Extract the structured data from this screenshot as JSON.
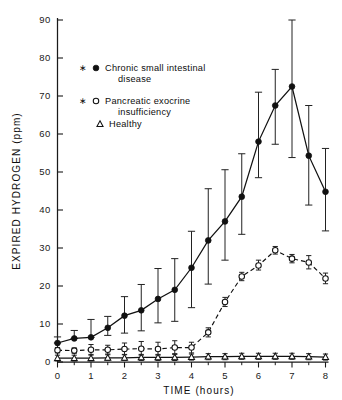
{
  "chart_data": {
    "type": "line",
    "title": "",
    "xlabel": "TIME (hours)",
    "ylabel": "EXPIRED HYDROGEN (ppm)",
    "xlim": [
      0,
      8
    ],
    "ylim": [
      0,
      90
    ],
    "xticks": [
      0,
      1,
      2,
      3,
      4,
      5,
      6,
      7,
      8
    ],
    "xtick_labels": [
      "0",
      "1",
      "2",
      "3",
      "4",
      "5",
      "6",
      "7",
      "8"
    ],
    "yticks": [
      0,
      10,
      20,
      30,
      40,
      50,
      60,
      70,
      80,
      90
    ],
    "ytick_labels": [
      "0",
      "10",
      "20",
      "30",
      "40",
      "50",
      "60",
      "70",
      "80",
      "90"
    ],
    "x_minor_step": 0.5,
    "grid": false,
    "legend_position": "upper-left-inset",
    "x": [
      0,
      0.5,
      1,
      1.5,
      2,
      2.5,
      3,
      3.5,
      4,
      4.5,
      5,
      5.5,
      6,
      6.5,
      7,
      7.5,
      8
    ],
    "series": [
      {
        "name": "Chronic small intestinal disease",
        "marker": "filled-circle",
        "linestyle": "solid",
        "color": "#111111",
        "values": [
          5.0,
          6.2,
          6.5,
          9.0,
          12.2,
          13.6,
          16.6,
          19.0,
          24.8,
          32.0,
          37.0,
          43.5,
          58.0,
          67.5,
          72.5,
          54.3,
          44.8
        ],
        "error_upper": [
          6.6,
          8.3,
          11.2,
          12.0,
          17.2,
          20.4,
          24.6,
          27.2,
          34.4,
          45.6,
          50.6,
          54.8,
          71.0,
          77.0,
          90.5,
          67.5,
          56.2
        ],
        "error_lower": [
          5.0,
          6.2,
          6.5,
          7.0,
          7.6,
          8.2,
          10.3,
          10.7,
          14.3,
          20.5,
          26.8,
          33.6,
          48.5,
          57.3,
          53.8,
          41.3,
          34.5
        ]
      },
      {
        "name": "Pancreatic exocrine insufficiency",
        "marker": "open-circle",
        "linestyle": "dashed",
        "color": "#111111",
        "values": [
          3.1,
          3.0,
          3.2,
          3.2,
          3.4,
          3.5,
          3.4,
          3.8,
          3.8,
          7.8,
          15.8,
          22.5,
          25.4,
          29.4,
          27.2,
          26.2,
          22.0
        ],
        "error_upper": [
          3.8,
          3.7,
          4.6,
          4.4,
          5.0,
          5.4,
          5.2,
          5.6,
          5.2,
          9.0,
          17.0,
          23.6,
          26.8,
          30.4,
          28.3,
          28.0,
          23.4
        ],
        "error_lower": [
          2.4,
          2.3,
          2.0,
          2.1,
          2.0,
          1.8,
          1.8,
          2.2,
          2.4,
          6.6,
          14.6,
          21.4,
          24.2,
          28.4,
          26.1,
          24.5,
          20.6
        ]
      },
      {
        "name": "Healthy",
        "marker": "open-triangle",
        "linestyle": "solid",
        "color": "#111111",
        "values": [
          1.0,
          1.0,
          1.0,
          1.1,
          1.1,
          1.2,
          1.2,
          1.2,
          1.3,
          1.4,
          1.4,
          1.5,
          1.5,
          1.5,
          1.5,
          1.4,
          1.3
        ],
        "error_upper": [
          1.8,
          1.8,
          1.8,
          1.9,
          1.9,
          2.0,
          2.0,
          2.0,
          2.1,
          2.2,
          2.2,
          2.3,
          2.3,
          2.3,
          2.3,
          2.2,
          2.1
        ],
        "error_lower": [
          0.3,
          0.3,
          0.3,
          0.4,
          0.4,
          0.4,
          0.4,
          0.4,
          0.5,
          0.6,
          0.6,
          0.7,
          0.7,
          0.7,
          0.7,
          0.6,
          0.5
        ]
      }
    ]
  },
  "legend": {
    "items": [
      {
        "marker": "filled-circle",
        "line1": "Chronic small intestinal",
        "line2": "disease"
      },
      {
        "marker": "open-circle",
        "line1": "Pancreatic  exocrine",
        "line2": "insufficiency"
      },
      {
        "marker": "open-triangle",
        "line1": "Healthy",
        "line2": ""
      }
    ]
  }
}
